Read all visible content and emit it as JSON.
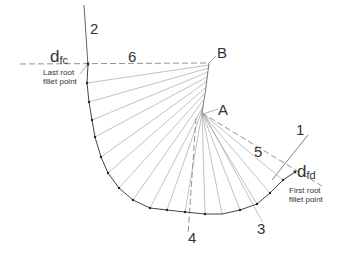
{
  "diagram": {
    "labels": {
      "line1": "1",
      "line2": "2",
      "line3": "3",
      "line4": "4",
      "line5": "5",
      "line6": "6",
      "pointA": "A",
      "pointB": "B",
      "dfc_main": "d",
      "dfc_sub": "fc",
      "dfd_main": "d",
      "dfd_sub": "fd",
      "last_root_line1": "Last root",
      "last_root_line2": "fillet point",
      "first_root_line1": "First root",
      "first_root_line2": "fillet point"
    },
    "colors": {
      "stroke": "#555555",
      "light": "#888888",
      "text": "#333333"
    }
  }
}
